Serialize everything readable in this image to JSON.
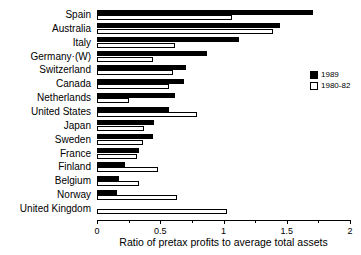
{
  "chart_data": {
    "type": "bar",
    "orientation": "horizontal",
    "title": "",
    "xlabel": "Ratio of pretax profits to average total assets",
    "ylabel": "",
    "xlim": [
      0,
      2
    ],
    "xticks": [
      0,
      0.5,
      1,
      1.5,
      2
    ],
    "xtick_labels": [
      "0",
      "0.5",
      "1",
      "1.5",
      "2"
    ],
    "xtick_minor": [
      0.25,
      0.75,
      1.25,
      1.75
    ],
    "grid": false,
    "legend_position": "right",
    "categories": [
      "Spain",
      "Australia",
      "Italy",
      "Germany·(W)",
      "Switzerland",
      "Canada",
      "Netherlands",
      "United States",
      "Japan",
      "Sweden",
      "France",
      "Finland",
      "Belgium",
      "Norway",
      "United Kingdom"
    ],
    "series": [
      {
        "name": "1989",
        "color": "#000000",
        "values": [
          1.71,
          1.45,
          1.12,
          0.87,
          0.7,
          0.69,
          0.62,
          0.57,
          0.45,
          0.44,
          0.33,
          0.22,
          0.17,
          0.16,
          0.0
        ]
      },
      {
        "name": "1980-82",
        "color": "#ffffff",
        "values": [
          1.07,
          1.39,
          0.62,
          0.44,
          0.6,
          0.57,
          0.25,
          0.79,
          0.37,
          0.36,
          0.32,
          0.48,
          0.33,
          0.63,
          1.03
        ]
      }
    ]
  }
}
